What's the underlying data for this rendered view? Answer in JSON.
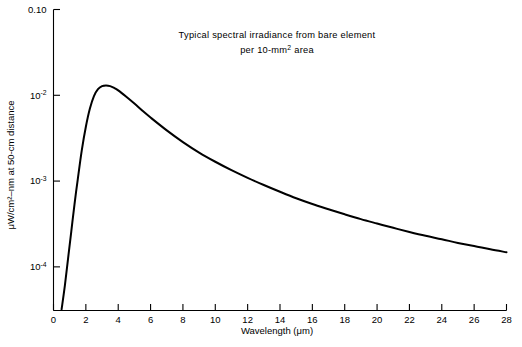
{
  "chart_data": {
    "type": "line",
    "title": "",
    "annotations": [
      "Typical spectral irradiance from bare element",
      "per 10-mm² area"
    ],
    "annotation_line1": "Typical spectral irradiance from bare element",
    "annotation_line2_pre": "per 10-mm",
    "annotation_line2_sup": "2",
    "annotation_line2_post": " area",
    "xlabel": "Wavelength (μm)",
    "ylabel": "μW/cm²–nm at 50-cm distance",
    "xlim": [
      0,
      28
    ],
    "ylim_log": [
      3.1e-05,
      0.1
    ],
    "yscale": "log",
    "xscale": "linear",
    "grid": false,
    "legend": null,
    "x_ticks": [
      0,
      2,
      4,
      6,
      8,
      10,
      12,
      14,
      16,
      18,
      20,
      22,
      24,
      26,
      28
    ],
    "x_tick_labels": [
      "0",
      "2",
      "4",
      "6",
      "8",
      "10",
      "12",
      "14",
      "16",
      "18",
      "20",
      "22",
      "24",
      "26",
      "28"
    ],
    "y_ticks": [
      0.1,
      0.01,
      0.001,
      0.0001
    ],
    "y_tick_labels": [
      "0.10",
      "10⁻²",
      "10⁻³",
      "10⁻⁴"
    ],
    "y_tick_label_top": "0.10",
    "y_tick_exponents": [
      "-2",
      "-3",
      "-4"
    ],
    "series": [
      {
        "name": "spectral irradiance",
        "x": [
          0.5,
          0.7,
          0.9,
          1.1,
          1.3,
          1.5,
          1.75,
          2.0,
          2.25,
          2.5,
          2.75,
          3.0,
          3.25,
          3.5,
          3.75,
          4.0,
          4.5,
          5.0,
          5.5,
          6.0,
          7.0,
          8.0,
          9.0,
          10.0,
          11.0,
          12.0,
          13.0,
          14.0,
          15.0,
          16.0,
          17.0,
          18.0,
          19.0,
          20.0,
          21.0,
          22.0,
          23.0,
          24.0,
          25.0,
          26.0,
          27.0,
          28.0
        ],
        "y": [
          3.2e-05,
          6e-05,
          0.000125,
          0.00026,
          0.00054,
          0.00105,
          0.0023,
          0.0043,
          0.007,
          0.0098,
          0.0118,
          0.0128,
          0.013,
          0.0128,
          0.0122,
          0.0114,
          0.0096,
          0.008,
          0.0066,
          0.0055,
          0.0039,
          0.00285,
          0.00215,
          0.00168,
          0.00134,
          0.00109,
          0.0009,
          0.00075,
          0.00063,
          0.00054,
          0.00047,
          0.00041,
          0.00036,
          0.00032,
          0.000285,
          0.000255,
          0.00023,
          0.00021,
          0.00019,
          0.000175,
          0.00016,
          0.000148
        ]
      }
    ]
  },
  "figure": {
    "caption": ""
  }
}
